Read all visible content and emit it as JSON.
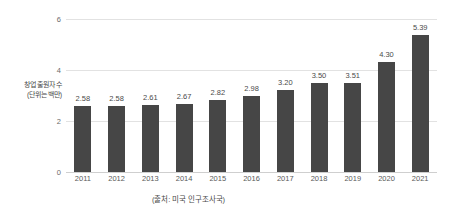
{
  "chart_data": {
    "type": "bar",
    "title": "",
    "xlabel": "",
    "ylabel": "창업 출원자 수\n(단위는 백만)",
    "ylabel_line1": "창업 출원자 수",
    "ylabel_line2": "(단위는 백만)",
    "categories": [
      "2011",
      "2012",
      "2013",
      "2014",
      "2015",
      "2016",
      "2017",
      "2018",
      "2019",
      "2020",
      "2021"
    ],
    "values": [
      2.58,
      2.58,
      2.61,
      2.67,
      2.82,
      2.98,
      3.2,
      3.5,
      3.51,
      4.3,
      5.39
    ],
    "value_labels": [
      "2.58",
      "2.58",
      "2.61",
      "2.67",
      "2.82",
      "2.98",
      "3.20",
      "3.50",
      "3.51",
      "4.30",
      "5.39"
    ],
    "ylim": [
      0,
      6
    ],
    "yticks": [
      0,
      2,
      4,
      6
    ],
    "ytick_labels": [
      "0",
      "2",
      "4",
      "6"
    ],
    "grid": true,
    "legend": "none",
    "source_note": "(출처: 미국 인구조사국)",
    "colors": {
      "bar": "#464646",
      "gridline": "#e2e2e2",
      "baseline": "#cfcfcf",
      "text": "#4a4a4a",
      "background": "#ffffff"
    }
  }
}
